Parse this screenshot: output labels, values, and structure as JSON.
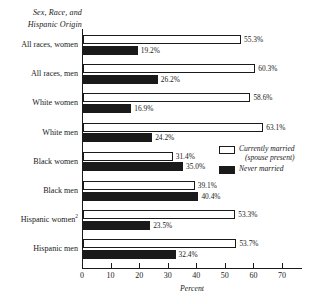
{
  "header": {
    "line1": "Sex, Race, and",
    "line2": "Hispanic Origin"
  },
  "legend": {
    "married_label": "Currently married",
    "married_sub": "(spouse present)",
    "never_label": "Never married"
  },
  "axis": {
    "xlabel": "Percent",
    "ticks": [
      "0",
      "10",
      "20",
      "30",
      "40",
      "50",
      "60",
      "70"
    ]
  },
  "colors": {
    "married": "#ffffff",
    "never": "#1a1a1a",
    "axis": "#1a1a1a"
  },
  "categories": [
    {
      "label": "All races, women",
      "sup": ""
    },
    {
      "label": "All races, men",
      "sup": ""
    },
    {
      "label": "White women",
      "sup": ""
    },
    {
      "label": "White men",
      "sup": ""
    },
    {
      "label": "Black women",
      "sup": ""
    },
    {
      "label": "Black men",
      "sup": ""
    },
    {
      "label": "Hispanic women",
      "sup": "2"
    },
    {
      "label": "Hispanic men",
      "sup": ""
    }
  ],
  "values": {
    "married": [
      "55.3%",
      "60.3%",
      "58.6%",
      "63.1%",
      "31.4%",
      "39.1%",
      "53.3%",
      "53.7%"
    ],
    "never": [
      "19.2%",
      "26.2%",
      "16.9%",
      "24.2%",
      "35.0%",
      "40.4%",
      "23.5%",
      "32.4%"
    ]
  },
  "chart_data": {
    "type": "bar",
    "orientation": "horizontal",
    "title": "",
    "xlabel": "Percent",
    "ylabel": "Sex, Race, and Hispanic Origin",
    "xlim": [
      0,
      70
    ],
    "xticks": [
      0,
      10,
      20,
      30,
      40,
      50,
      60,
      70
    ],
    "grid": false,
    "legend_position": "center-right",
    "categories": [
      "All races, women",
      "All races, men",
      "White women",
      "White men",
      "Black women",
      "Black men",
      "Hispanic women",
      "Hispanic men"
    ],
    "series": [
      {
        "name": "Currently married (spouse present)",
        "color": "#ffffff",
        "values": [
          55.3,
          60.3,
          58.6,
          63.1,
          31.4,
          39.1,
          53.3,
          53.7
        ]
      },
      {
        "name": "Never married",
        "color": "#1a1a1a",
        "values": [
          19.2,
          26.2,
          16.9,
          24.2,
          35.0,
          40.4,
          23.5,
          32.4
        ]
      }
    ],
    "annotations": [
      "Hispanic women carries footnote marker 2"
    ]
  }
}
